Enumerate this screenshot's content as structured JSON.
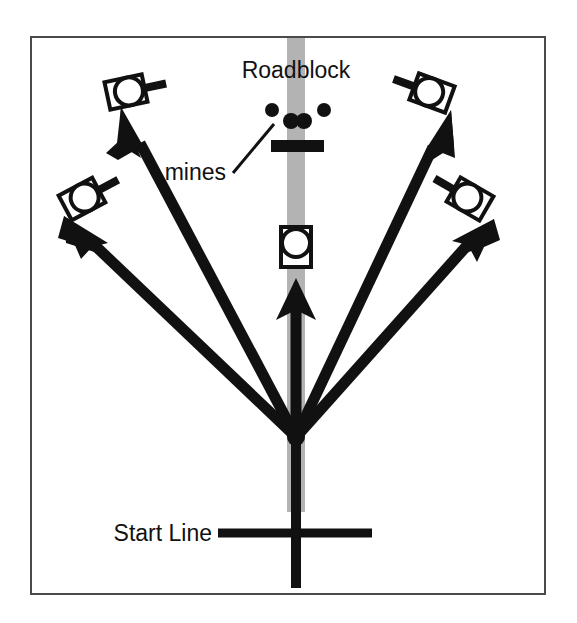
{
  "figure": {
    "background_color": "#ffffff",
    "border_color": "#4a4a4a",
    "road_color": "#b3b3b3",
    "ink_color": "#111111"
  },
  "labels": {
    "roadblock": "Roadblock",
    "mines": "mines",
    "start_line": "Start Line"
  },
  "diagram_data": {
    "type": "schematic",
    "frame": {
      "x": 31,
      "y": 37,
      "width": 514,
      "height": 557
    },
    "road": {
      "name": "road",
      "center_x": 296,
      "width": 18,
      "top_y": 38,
      "bottom_y": 512,
      "color": "#b3b3b3"
    },
    "start_line": {
      "name": "start-line",
      "y": 533,
      "x1": 218,
      "x2": 372,
      "thickness": 9
    },
    "center_stem": {
      "name": "center-stem",
      "x": 296,
      "top_y": 435,
      "bottom_y": 588,
      "thickness": 9
    },
    "convergence_point": {
      "x": 296,
      "y": 437
    },
    "paths": [
      {
        "id": "path-outer-left",
        "name": "arrow-outer-left",
        "tip": {
          "x": 121,
          "y": 107
        },
        "label_side": "left"
      },
      {
        "id": "path-inner-left",
        "name": "arrow-inner-left",
        "tip": {
          "x": 64,
          "y": 216
        },
        "label_side": "left"
      },
      {
        "id": "path-center",
        "name": "arrow-center",
        "tip": {
          "x": 296,
          "y": 278
        },
        "label_side": "center"
      },
      {
        "id": "path-inner-right",
        "name": "arrow-inner-right",
        "tip": {
          "x": 451,
          "y": 110
        },
        "label_side": "right"
      },
      {
        "id": "path-outer-right",
        "name": "arrow-outer-right",
        "tip": {
          "x": 494,
          "y": 219
        },
        "label_side": "right"
      }
    ],
    "robots": [
      {
        "id": "robot-top-left",
        "name": "robot-icon-top-left",
        "x": 126,
        "y": 92,
        "rotation": -12,
        "barrel": "right"
      },
      {
        "id": "robot-mid-left",
        "name": "robot-icon-mid-left",
        "x": 82,
        "y": 199,
        "rotation": -28,
        "barrel": "right"
      },
      {
        "id": "robot-center",
        "name": "robot-icon-center-road",
        "x": 296,
        "y": 247,
        "rotation": 0,
        "barrel": "none"
      },
      {
        "id": "robot-top-right",
        "name": "robot-icon-top-right",
        "x": 432,
        "y": 93,
        "rotation": 20,
        "barrel": "left"
      },
      {
        "id": "robot-mid-right",
        "name": "robot-icon-mid-right",
        "x": 470,
        "y": 199,
        "rotation": 30,
        "barrel": "left"
      }
    ],
    "mines": [
      {
        "id": "mine-left-outer",
        "name": "mine-dot",
        "cx": 272,
        "cy": 110,
        "r": 7
      },
      {
        "id": "mine-center-left",
        "name": "mine-dot",
        "cx": 291,
        "cy": 121,
        "r": 8
      },
      {
        "id": "mine-center-right",
        "name": "mine-dot",
        "cx": 304,
        "cy": 121,
        "r": 8
      },
      {
        "id": "mine-right-outer",
        "name": "mine-dot",
        "cx": 324,
        "cy": 110,
        "r": 7
      }
    ],
    "mines_leader_line": {
      "x1": 233,
      "y1": 173,
      "x2": 274,
      "y2": 124
    },
    "roadblock_bar": {
      "x": 271,
      "y": 140,
      "width": 53,
      "height": 12
    },
    "label_positions": {
      "roadblock": {
        "x": 296,
        "y": 78,
        "anchor": "middle"
      },
      "mines": {
        "x": 226,
        "y": 180,
        "anchor": "end"
      },
      "start_line": {
        "x": 212,
        "y": 541,
        "anchor": "end"
      }
    }
  }
}
